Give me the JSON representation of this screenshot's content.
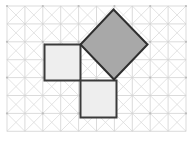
{
  "figure": {
    "title": "Pythagorean theorem squares on a diagonal grid",
    "canvas": {
      "width": 194,
      "height": 146,
      "background": "#ffffff"
    },
    "grid": {
      "x0": 7,
      "y0": 6,
      "cell": 17.9,
      "cols": 10,
      "rows": 7,
      "line_color": "#d2d2d2",
      "diagonal_color": "#dcdcdc",
      "line_width": 0.8,
      "show_diagonals": true,
      "show_vertex_dots": true,
      "vertex_dot_color": "#bdbdbd",
      "vertex_dot_radius": 1.1,
      "vertex_dot_step": 2
    },
    "shapes": [
      {
        "name": "leg-square-left",
        "role": "leg-a",
        "kind": "square",
        "orientation": "axis-aligned",
        "points": "44.5,44.5 80.5,44.5 80.5,80.5 44.5,80.5",
        "fill": "#eeeeee",
        "stroke": "#3a3a3a",
        "stroke_width": 2,
        "side_cells": 2
      },
      {
        "name": "leg-square-bottom",
        "role": "leg-b",
        "kind": "square",
        "orientation": "axis-aligned",
        "points": "80.5,80.5 116.5,80.5 116.5,117.5 80.5,117.5",
        "fill": "#eeeeee",
        "stroke": "#3a3a3a",
        "stroke_width": 2,
        "side_cells": 2
      },
      {
        "name": "hypotenuse-square-tilted",
        "role": "hypotenuse",
        "kind": "square",
        "orientation": "rotated-45",
        "points": "113.5,9.5 147.5,44.5 114,79.5 80.5,44.5",
        "fill": "#a8a8a8",
        "stroke": "#2f2f2f",
        "stroke_width": 2,
        "side_cells": 2.83
      }
    ]
  },
  "chart_data": {
    "type": "diagram",
    "title": "Pythagorean theorem squares on a diagonal grid",
    "squares": [
      {
        "label": "leg-a",
        "fill": "#eeeeee",
        "area_cells": 4,
        "orientation_deg": 0
      },
      {
        "label": "leg-b",
        "fill": "#eeeeee",
        "area_cells": 4,
        "orientation_deg": 0
      },
      {
        "label": "hypotenuse",
        "fill": "#a8a8a8",
        "area_cells": 8,
        "orientation_deg": 45
      }
    ],
    "relation": "area(leg-a) + area(leg-b) = area(hypotenuse)",
    "grid_on": true,
    "legend": []
  }
}
